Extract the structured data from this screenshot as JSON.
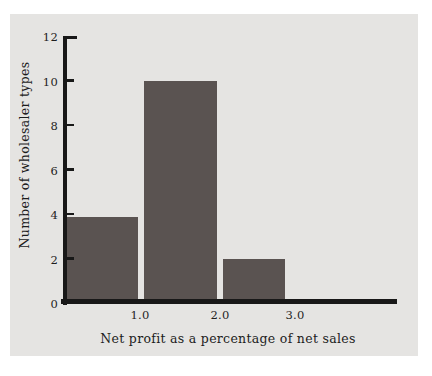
{
  "figure": {
    "page_background": "#ffffff",
    "panel_background": "#e5e4e2",
    "text_color": "#1c1c1c"
  },
  "chart_data": {
    "type": "bar",
    "title": "",
    "xlabel": "Net profit as a percentage of net sales",
    "ylabel": "Number of wholesaler types",
    "bins": [
      [
        0.0,
        1.0
      ],
      [
        1.0,
        2.0
      ],
      [
        2.0,
        3.0
      ]
    ],
    "values": [
      4,
      10,
      2
    ],
    "drawn_values": [
      3.87,
      10,
      2
    ],
    "x_tick_labels": [
      "1.0",
      "2.0",
      "3.0"
    ],
    "y_tick_labels": [
      "12",
      "10",
      "8",
      "6",
      "4",
      "2",
      "0"
    ],
    "y_tick_values": [
      12,
      10,
      8,
      6,
      4,
      2,
      0
    ],
    "ylim": [
      0,
      12
    ],
    "xlim": [
      0,
      4.3
    ],
    "grid": false,
    "legend": null,
    "bar_color": "#5a5351",
    "axis_color": "#181818"
  }
}
